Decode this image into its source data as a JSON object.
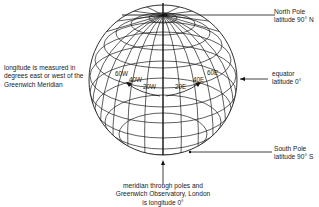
{
  "diagram": {
    "annotations": {
      "north_pole": {
        "line1": "North Pole",
        "line2": "latitude 90° N"
      },
      "equator": {
        "line1": "equator",
        "line2": "latitude 0°"
      },
      "south_pole": {
        "line1": "South Pole",
        "line2": "latitude 90° S"
      },
      "longitude_note": {
        "line1": "longitude is measured in",
        "line2": "degrees east or west of the",
        "line3": "Greenwich Meridian"
      },
      "prime_meridian": {
        "line1": "meridian through poles and",
        "line2": "Greenwich Observatory, London",
        "line3": "is longitude 0°"
      }
    },
    "longitude_labels": {
      "w60": "60W",
      "w40": "40W",
      "w20": "20W",
      "e20": "20E",
      "e40": "40E",
      "e60": "60E"
    },
    "colors": {
      "ink": "#1a1a1a",
      "background": "#ffffff"
    }
  }
}
